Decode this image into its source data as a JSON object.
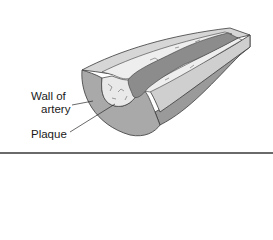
{
  "figure": {
    "labels": {
      "wall_line1": "Wall of",
      "wall_line2": "artery",
      "plaque": "Plaque"
    },
    "colors": {
      "wall_section": "#a9a9a9",
      "wall_top": "#d6d6d6",
      "wall_side": "#9a9a9a",
      "plaque": "#e9e9e9",
      "lumen": "#8c8c8c",
      "outline": "#3a3a3a",
      "rule": "#6a6a6a"
    }
  }
}
